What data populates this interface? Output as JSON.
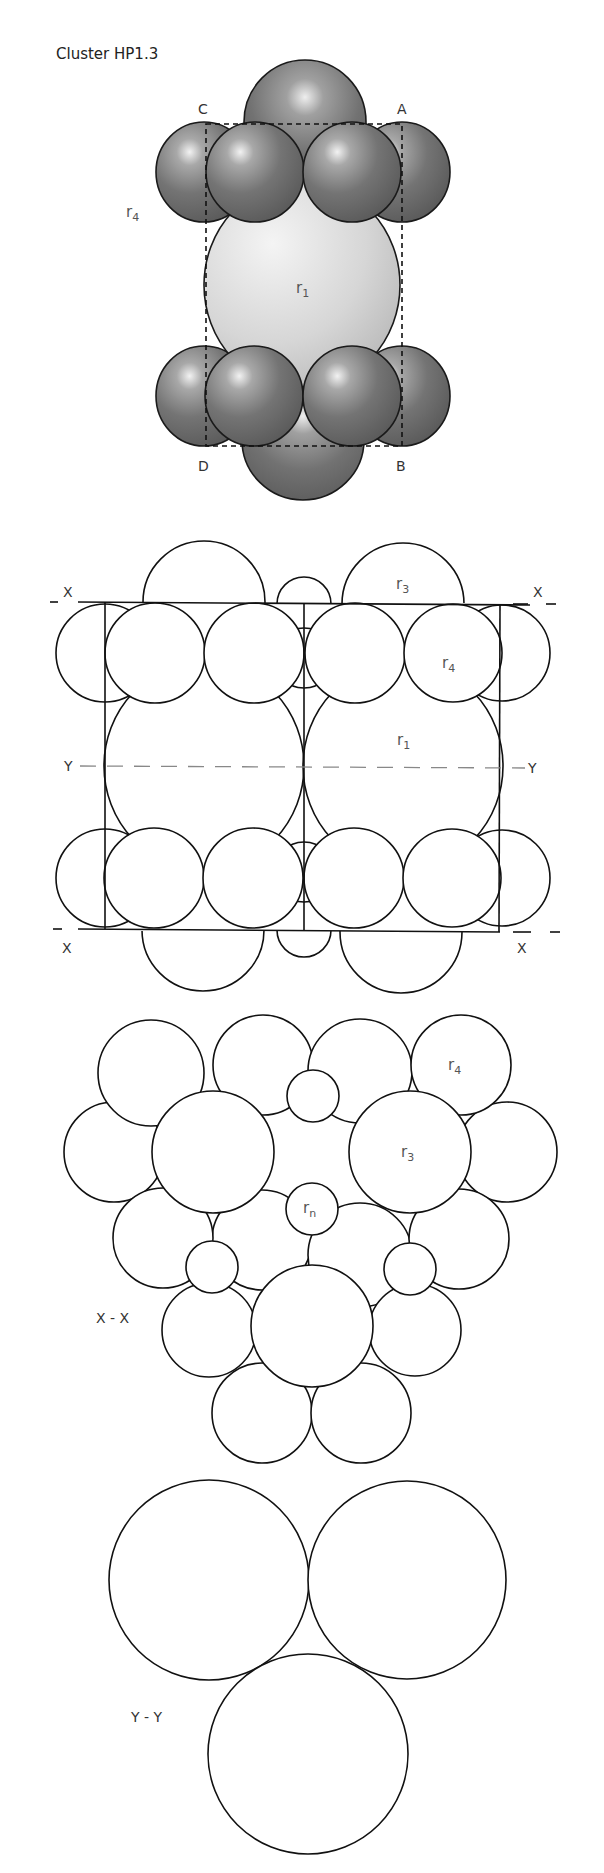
{
  "title": "Cluster HP1.3",
  "colors": {
    "sphere_dark": "#6a6a6a",
    "sphere_light": "#cfcfcf",
    "outline": "#111111",
    "label": "#555555"
  },
  "views": {
    "perspective": {
      "corner_labels": {
        "c": "C",
        "a": "A",
        "d": "D",
        "b": "B"
      },
      "radius_labels": {
        "r4": {
          "base": "r",
          "sub": "4"
        },
        "r1": {
          "base": "r",
          "sub": "1"
        }
      }
    },
    "elevation": {
      "section_marks": {
        "x_top_left": "X",
        "x_top_right": "X",
        "y_left": "Y",
        "y_right": "Y",
        "x_bottom_left": "X",
        "x_bottom_right": "X"
      },
      "radius_labels": {
        "r3": {
          "base": "r",
          "sub": "3"
        },
        "r4": {
          "base": "r",
          "sub": "4"
        },
        "r1": {
          "base": "r",
          "sub": "1"
        }
      }
    },
    "section_xx": {
      "caption": "X - X",
      "radius_labels": {
        "r4": {
          "base": "r",
          "sub": "4"
        },
        "r3": {
          "base": "r",
          "sub": "3"
        },
        "rn": {
          "base": "r",
          "sub": "n"
        }
      }
    },
    "section_yy": {
      "caption": "Y - Y"
    }
  }
}
